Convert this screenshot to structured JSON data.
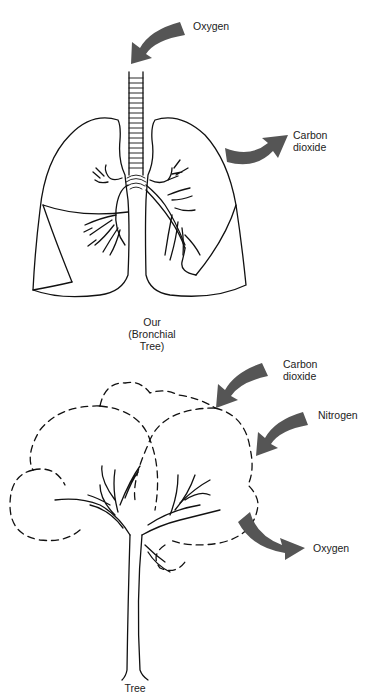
{
  "colors": {
    "arrow": "#555555",
    "line": "#111111"
  },
  "lungs": {
    "caption_line1": "Our",
    "caption_line2": "(Bronchial",
    "caption_line3": "Tree)",
    "arrows": [
      {
        "label": "Oxygen",
        "direction": "in",
        "icon": "curved-arrow-down-left"
      },
      {
        "label_line1": "Carbon",
        "label_line2": "dioxide",
        "direction": "out",
        "icon": "curved-arrow-up-right"
      }
    ]
  },
  "tree": {
    "caption": "Tree",
    "arrows": [
      {
        "label_line1": "Carbon",
        "label_line2": "dioxide",
        "direction": "in",
        "icon": "curved-arrow-down-left"
      },
      {
        "label": "Nitrogen",
        "direction": "in",
        "icon": "curved-arrow-down-left"
      },
      {
        "label": "Oxygen",
        "direction": "out",
        "icon": "curved-arrow-down-right"
      }
    ]
  }
}
